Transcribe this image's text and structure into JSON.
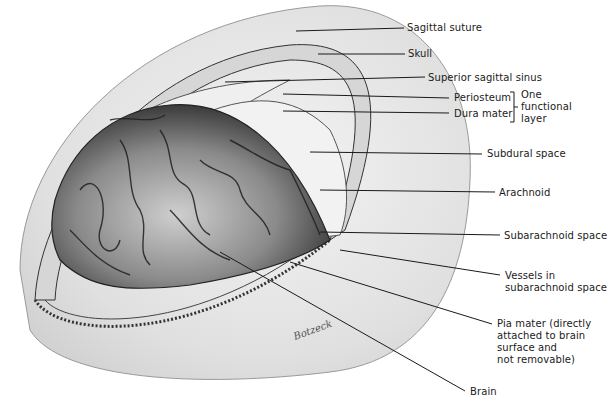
{
  "figure": {
    "colors": {
      "ink": "#1a1a1a",
      "skull": "#e2e2e2",
      "brain_dark": "#4a4a4a",
      "brain_light": "#d8d8d8",
      "background": "#ffffff"
    }
  },
  "labels": {
    "sagittal_suture": "Sagittal suture",
    "skull": "Skull",
    "superior_sagittal_sinus": "Superior sagittal sinus",
    "periosteum": "Periosteum",
    "dura_mater": "Dura mater",
    "group_note": [
      "One",
      "functional",
      "layer"
    ],
    "subdural_space": "Subdural space",
    "arachnoid": "Arachnoid",
    "subarachnoid_space": "Subarachnoid space",
    "vessels": [
      "Vessels in",
      "subarachnoid space"
    ],
    "pia_mater": [
      "Pia mater (directly",
      "attached to brain",
      "surface and",
      "not removable)"
    ],
    "brain": "Brain"
  },
  "signature": "Botzeck"
}
